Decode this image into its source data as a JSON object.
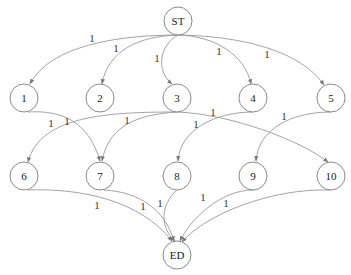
{
  "diagram": {
    "type": "directed-graph",
    "nodes": [
      {
        "id": "ST",
        "label": "ST",
        "x": 178,
        "y": 21
      },
      {
        "id": "1",
        "label": "1",
        "x": 24,
        "y": 98
      },
      {
        "id": "2",
        "label": "2",
        "x": 100,
        "y": 98
      },
      {
        "id": "3",
        "label": "3",
        "x": 177,
        "y": 98
      },
      {
        "id": "4",
        "label": "4",
        "x": 253,
        "y": 98
      },
      {
        "id": "5",
        "label": "5",
        "x": 331,
        "y": 98
      },
      {
        "id": "6",
        "label": "6",
        "x": 24,
        "y": 176
      },
      {
        "id": "7",
        "label": "7",
        "x": 100,
        "y": 176
      },
      {
        "id": "8",
        "label": "8",
        "x": 177,
        "y": 176
      },
      {
        "id": "9",
        "label": "9",
        "x": 253,
        "y": 176
      },
      {
        "id": "10",
        "label": "10",
        "x": 331,
        "y": 176
      },
      {
        "id": "ED",
        "label": "ED",
        "x": 177,
        "y": 255
      }
    ],
    "edges": [
      {
        "from": "ST",
        "to": "1",
        "label": "1",
        "d": "M178,35 C120,35 50,45 30,84",
        "lx": 92,
        "ly": 38
      },
      {
        "from": "ST",
        "to": "2",
        "label": "1",
        "d": "M178,35 C140,36 108,50 102,84",
        "lx": 116,
        "ly": 48
      },
      {
        "from": "ST",
        "to": "3",
        "label": "1",
        "d": "M178,35 C160,45 155,70 172,84",
        "lx": 157,
        "ly": 58
      },
      {
        "from": "ST",
        "to": "4",
        "label": "1",
        "d": "M178,35 C215,36 245,55 251,84",
        "lx": 219,
        "ly": 51
      },
      {
        "from": "ST",
        "to": "5",
        "label": "1",
        "d": "M178,35 C240,36 300,50 324,85",
        "lx": 267,
        "ly": 54
      },
      {
        "from": "1",
        "to": "7",
        "label": "1",
        "d": "M28,112 C60,110 88,120 100,161",
        "lx": 67,
        "ly": 121
      },
      {
        "from": "3",
        "to": "6",
        "label": "1",
        "d": "M177,112 C110,112 40,115 28,162",
        "lx": 51,
        "ly": 123
      },
      {
        "from": "3",
        "to": "7",
        "label": "1",
        "d": "M177,112 C130,115 108,130 102,161",
        "lx": 127,
        "ly": 120
      },
      {
        "from": "3",
        "to": "10",
        "label": "1",
        "d": "M177,112 C230,114 300,140 328,162",
        "lx": 213,
        "ly": 112
      },
      {
        "from": "4",
        "to": "8",
        "label": "1",
        "d": "M253,112 C215,112 180,130 178,161",
        "lx": 196,
        "ly": 124
      },
      {
        "from": "5",
        "to": "9",
        "label": "1",
        "d": "M331,112 C290,112 258,130 256,161",
        "lx": 284,
        "ly": 116
      },
      {
        "from": "6",
        "to": "ED",
        "label": "1",
        "d": "M28,190 C80,188 140,200 172,241",
        "lx": 97,
        "ly": 205
      },
      {
        "from": "7",
        "to": "ED",
        "label": "1",
        "d": "M104,190 C140,192 165,210 174,241",
        "lx": 143,
        "ly": 206
      },
      {
        "from": "8",
        "to": "ED",
        "label": "1",
        "d": "M177,190 C160,205 160,228 175,241",
        "lx": 160,
        "ly": 203
      },
      {
        "from": "9",
        "to": "ED",
        "label": "1",
        "d": "M253,190 C220,190 190,220 180,241",
        "lx": 203,
        "ly": 197
      },
      {
        "from": "10",
        "to": "ED",
        "label": "1",
        "d": "M331,190 C270,188 205,215 182,242",
        "lx": 226,
        "ly": 203
      }
    ],
    "colors": {
      "node_stroke": "#8a8a8a",
      "edge_stroke": "#9a9a9a",
      "text": "#222222",
      "background": "#ffffff"
    }
  }
}
